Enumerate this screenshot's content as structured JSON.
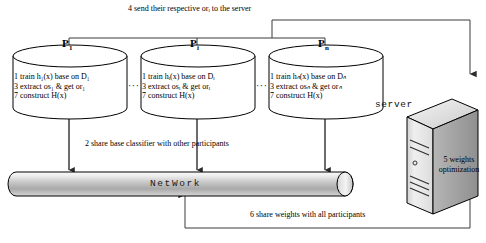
{
  "diagram": {
    "title_caption_top": "4 send their respective orᵢ to the server",
    "participants": [
      {
        "name": "P",
        "sub": "1",
        "lines": [
          "1 train h₁(x) base on D₁",
          "3 extract os₁ & get or₁",
          "7 construct H(x)"
        ]
      },
      {
        "name": "P",
        "sub": "i",
        "lines": [
          "1 train hᵢ(x) base on Dᵢ",
          "3 extract osᵢ & get orᵢ",
          "7 construct H(x)"
        ]
      },
      {
        "name": "P",
        "sub": "n",
        "lines": [
          "1 train hₙ(x) base on Dₙ",
          "3 extract osₙ & get orₙ",
          "7 construct H(x)"
        ]
      }
    ],
    "ellipsis": "···",
    "caption_share_classifier": "2 share base classifier with other participants",
    "network_label": "NetWork",
    "caption_share_weights": "6 share weights with all participants",
    "server_label": "server",
    "server_task_line1": "5 weights",
    "server_task_line2": "optimization",
    "colors": {
      "line": "#3a3a3a",
      "cylinder_stroke": "#000000",
      "cylinder_fill": "#ffffff",
      "network_fill_light": "#f2f2f2",
      "network_fill_mid": "#b8b8b8",
      "network_stroke": "#000000",
      "server_light": "#e9e9e9",
      "server_mid": "#cfcfcf",
      "server_dark": "#9a9a9a",
      "text": "#000000"
    }
  }
}
